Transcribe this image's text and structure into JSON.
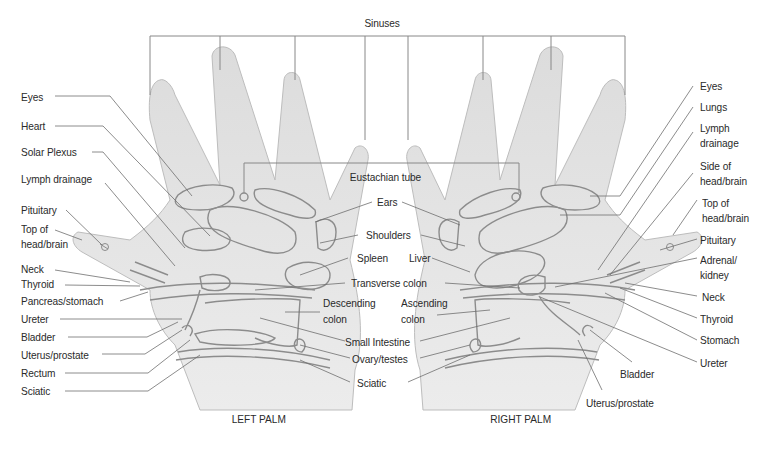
{
  "diagram": {
    "title_top": "Sinuses",
    "center_top": "Eustachian tube",
    "left_palm": {
      "caption": "LEFT PALM",
      "labels": [
        "Eyes",
        "Heart",
        "Solar Plexus",
        "Lymph drainage",
        "Pituitary",
        "Top of",
        "head/brain",
        "Neck",
        "Thyroid",
        "Pancreas/stomach",
        "Ureter",
        "Bladder",
        "Uterus/prostate",
        "Rectum",
        "Sciatic"
      ]
    },
    "right_palm": {
      "caption": "RIGHT PALM",
      "labels": [
        "Eyes",
        "Lungs",
        "Lymph",
        "drainage",
        "Side of",
        "head/brain",
        "Top of",
        "head/brain",
        "Pituitary",
        "Adrenal/",
        "kidney",
        "Neck",
        "Thyroid",
        "Stomach",
        "Ureter",
        "Bladder",
        "Uterus/prostate"
      ]
    },
    "center_labels": {
      "ears": "Ears",
      "shoulders": "Shoulders",
      "spleen": "Spleen",
      "liver": "Liver",
      "transverse_colon": "Transverse colon",
      "descending_1": "Descending",
      "descending_2": "colon",
      "ascending_1": "Ascending",
      "ascending_2": "colon",
      "small_intestine": "Small Intestine",
      "ovary_testes": "Ovary/testes",
      "sciatic": "Sciatic"
    },
    "colors": {
      "skin": "#e6e6e6",
      "outline": "#9a9a9a",
      "zone": "#8c8c8c",
      "leader": "#6e6e6e",
      "text": "#2a2a2a"
    }
  }
}
